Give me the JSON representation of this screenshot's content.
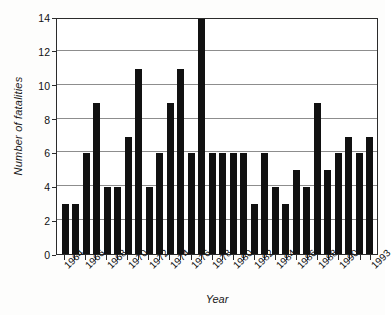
{
  "chart_data": {
    "type": "bar",
    "title": "",
    "xlabel": "Year",
    "ylabel": "Number of fatalities",
    "ylim": [
      0,
      14
    ],
    "yticks": [
      0,
      2,
      4,
      6,
      8,
      10,
      12,
      14
    ],
    "grid": true,
    "legend": null,
    "categories": [
      "1964",
      "1965",
      "1966",
      "1967",
      "1968",
      "1969",
      "1970",
      "1971",
      "1972",
      "1973",
      "1974",
      "1975",
      "1976",
      "1977",
      "1978",
      "1979",
      "1980",
      "1981",
      "1982",
      "1983",
      "1984",
      "1985",
      "1986",
      "1987",
      "1988",
      "1989",
      "1990",
      "1991",
      "1992",
      "1993"
    ],
    "tick_labels": [
      "1964",
      "",
      "1966",
      "",
      "1968",
      "",
      "1970",
      "",
      "1972",
      "",
      "1974",
      "",
      "1976",
      "",
      "1978",
      "",
      "1980",
      "",
      "1982",
      "",
      "1984",
      "",
      "1986",
      "",
      "1988",
      "",
      "1990",
      "",
      "",
      "1993"
    ],
    "values": [
      3,
      3,
      6,
      9,
      4,
      4,
      7,
      11,
      4,
      6,
      9,
      11,
      6,
      14,
      6,
      6,
      6,
      6,
      3,
      6,
      4,
      3,
      5,
      4,
      9,
      5,
      6,
      7,
      6,
      7
    ],
    "bar_color": "#111111",
    "axis_color": "#2b2b2b",
    "grid_color": "#8d8d8d",
    "background": "#ffffff"
  }
}
